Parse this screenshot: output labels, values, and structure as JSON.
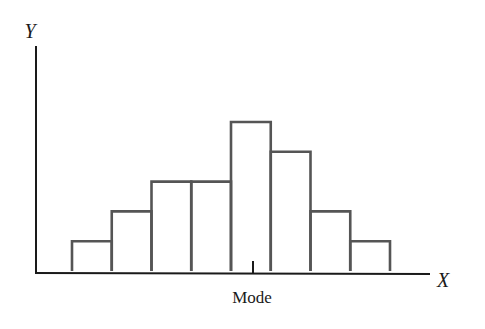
{
  "chart_data": {
    "type": "bar",
    "title": "",
    "xlabel": "X",
    "ylabel": "Y",
    "categories": [
      "1",
      "2",
      "3",
      "4",
      "5",
      "6",
      "7",
      "8"
    ],
    "values": [
      1,
      2,
      3,
      3,
      5,
      4,
      2,
      1
    ],
    "bar_style": "histogram, unfilled outline bars, adjacent",
    "annotations": [
      {
        "text": "Mode",
        "position": "x-axis tick under center of tallest bar (category 5)"
      }
    ],
    "grid": false,
    "legend": null,
    "ylim": [
      0,
      7.5
    ]
  },
  "labels": {
    "y_axis": "Y",
    "x_axis": "X",
    "mode": "Mode"
  },
  "colors": {
    "axis": "#1a1a1a",
    "bar_outline": "#555555",
    "background": "#ffffff"
  }
}
